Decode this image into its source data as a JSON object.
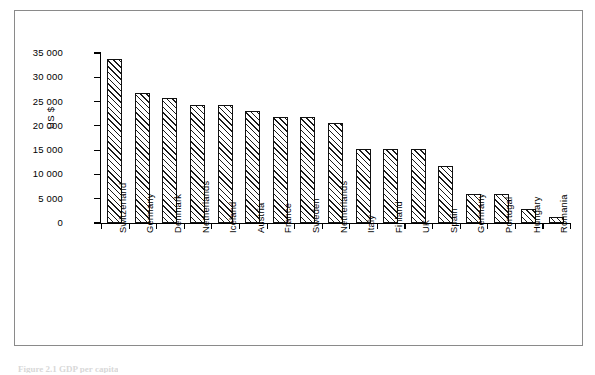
{
  "figure": {
    "caption_fragment": "Figure 2.1  GDP per capita",
    "frame_color": "#8a8a8a",
    "ink_color": "#000000"
  },
  "chart_data": {
    "type": "bar",
    "title": "",
    "xlabel": "",
    "ylabel": "US $",
    "ylim": [
      0,
      35000
    ],
    "ytick_values": [
      0,
      5000,
      10000,
      15000,
      20000,
      25000,
      30000,
      35000
    ],
    "ytick_labels": [
      "0",
      "5 000",
      "10 000",
      "15 000",
      "20 000",
      "25 000",
      "30 000",
      "35 000"
    ],
    "grid": false,
    "legend": false,
    "bar_style": "diagonal-hatch",
    "categories": [
      "Switzerland",
      "Germany",
      "Denmark",
      "Netherlands",
      "Iceland",
      "Austria",
      "France",
      "Sweden",
      "Netherlands",
      "Italy",
      "Finland",
      "UK",
      "Spain",
      "Germany",
      "Portugal",
      "Hungary",
      "Romania"
    ],
    "values": [
      33800,
      26800,
      25800,
      24200,
      24200,
      23000,
      21900,
      21800,
      20600,
      15200,
      15200,
      15200,
      11800,
      5900,
      5900,
      2900,
      1300
    ]
  }
}
